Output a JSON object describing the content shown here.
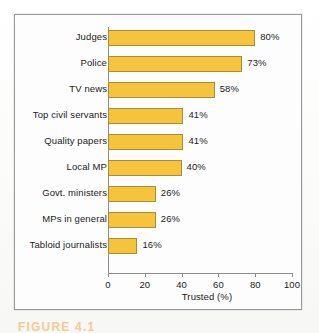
{
  "figure": {
    "caption": "FIGURE 4.1",
    "frame_color": "#9a9a9a",
    "bar_color": "#f5c33c",
    "bar_border_color": "#a98f33"
  },
  "chart_data": {
    "type": "bar",
    "orientation": "horizontal",
    "title": "",
    "xlabel": "Trusted (%)",
    "ylabel": "",
    "xlim": [
      0,
      100
    ],
    "xticks": [
      0,
      20,
      40,
      60,
      80,
      100
    ],
    "grid": false,
    "legend": "none",
    "categories": [
      "Judges",
      "Police",
      "TV news",
      "Top civil servants",
      "Quality papers",
      "Local MP",
      "Govt. ministers",
      "MPs in general",
      "Tabloid journalists"
    ],
    "values": [
      80,
      73,
      58,
      41,
      41,
      40,
      26,
      26,
      16
    ],
    "data_labels": [
      "80%",
      "73%",
      "58%",
      "41%",
      "41%",
      "40%",
      "26%",
      "26%",
      "16%"
    ]
  }
}
